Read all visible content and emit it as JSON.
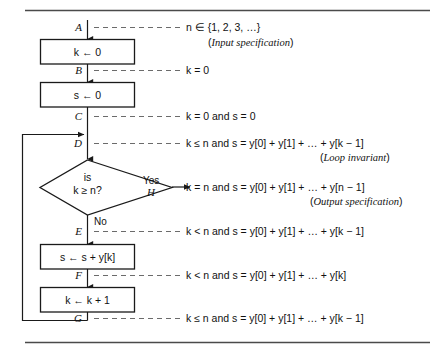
{
  "figure": {
    "process_boxes": [
      {
        "id": "box-k-init",
        "text": "k ← 0"
      },
      {
        "id": "box-s-init",
        "text": "s ← 0"
      },
      {
        "id": "box-s-accum",
        "text": "s ← s + y[k]"
      },
      {
        "id": "box-k-incr",
        "text": "k ← k + 1"
      }
    ],
    "decision": {
      "line1": "is",
      "line2": "k ≥ n?",
      "yes_label": "Yes",
      "no_label": "No"
    },
    "cut_points": [
      {
        "label": "A",
        "assertion": "n ∈ {1, 2, 3, …}",
        "note": "(Input specification)",
        "note_italic": "Input specification"
      },
      {
        "label": "B",
        "assertion": "k = 0",
        "note": "",
        "note_italic": ""
      },
      {
        "label": "C",
        "assertion": "k = 0 and s = 0",
        "note": "",
        "note_italic": ""
      },
      {
        "label": "D",
        "assertion": "k ≤ n and s = y[0] + y[1] + … + y[k − 1]",
        "note": "(Loop invariant)",
        "note_italic": "Loop invariant"
      },
      {
        "label": "H",
        "assertion": "k = n and s = y[0] + y[1] + … + y[n − 1]",
        "note": "(Output specification)",
        "note_italic": "Output specification"
      },
      {
        "label": "E",
        "assertion": "k < n and s = y[0] + y[1] + … + y[k − 1]",
        "note": "",
        "note_italic": ""
      },
      {
        "label": "F",
        "assertion": "k < n and s = y[0] + y[1] + … + y[k]",
        "note": "",
        "note_italic": ""
      },
      {
        "label": "G",
        "assertion": "k ≤ n and s = y[0] + y[1] + … + y[k − 1]",
        "note": "",
        "note_italic": ""
      }
    ],
    "colors": {
      "ink": "#111111",
      "rule": "#4a4a4a",
      "dash": "#6b6b6b",
      "background": "#ffffff"
    }
  }
}
